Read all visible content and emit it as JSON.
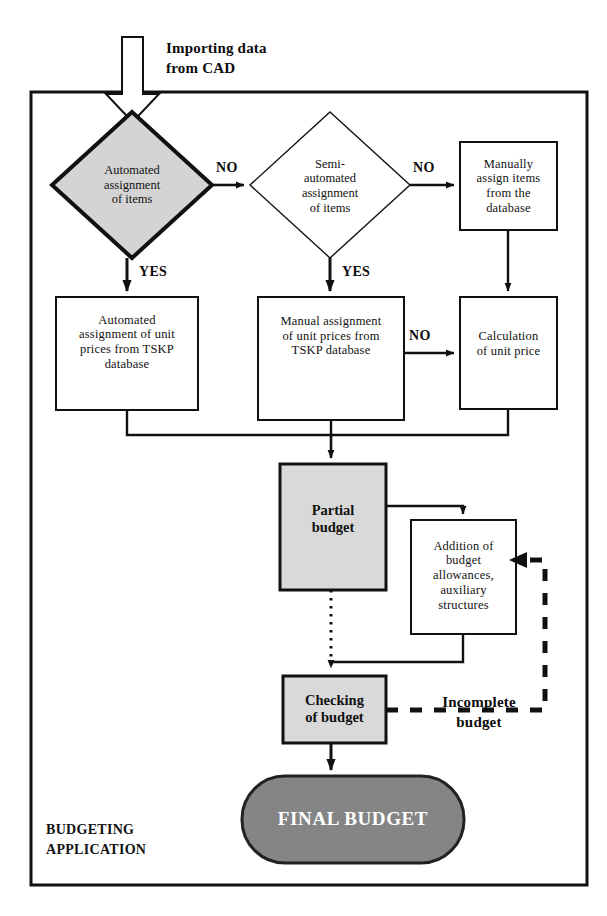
{
  "diagram": {
    "container_label_line1": "BUDGETING",
    "container_label_line2": "APPLICATION",
    "entry_label_line1": "Importing data",
    "entry_label_line2": "from CAD"
  },
  "nodes": {
    "automated_assignment": {
      "type": "decision",
      "line1": "Automated",
      "line2": "assignment",
      "line3": "of items",
      "fill": "#d4d4d4"
    },
    "semi_automated_assignment": {
      "type": "decision",
      "line1": "Semi-",
      "line2": "automated",
      "line3": "assignment",
      "line4": "of items",
      "fill": "#ffffff"
    },
    "manually_assign_items": {
      "type": "process",
      "line1": "Manually",
      "line2": "assign items",
      "line3": "from the",
      "line4": "database",
      "fill": "#ffffff"
    },
    "automated_unit_prices": {
      "type": "process",
      "line1": "Automated",
      "line2": "assignment of unit",
      "line3": "prices from TSKP",
      "line4": "database",
      "fill": "#ffffff"
    },
    "manual_unit_prices": {
      "type": "process",
      "line1": "Manual assignment",
      "line2": "of unit prices from",
      "line3": "TSKP database",
      "fill": "#ffffff"
    },
    "calculation_unit_price": {
      "type": "process",
      "line1": "Calculation",
      "line2": "of unit price",
      "fill": "#ffffff"
    },
    "partial_budget": {
      "type": "process",
      "line1": "Partial",
      "line2": "budget",
      "fill": "#d9d9d9"
    },
    "addition_allowances": {
      "type": "process",
      "line1": "Addition of",
      "line2": "budget",
      "line3": "allowances,",
      "line4": "auxiliary",
      "line5": "structures",
      "fill": "#ffffff"
    },
    "checking_budget": {
      "type": "process",
      "line1": "Checking",
      "line2": "of budget",
      "fill": "#d9d9d9"
    },
    "final_budget": {
      "type": "terminator",
      "label": "FINAL BUDGET",
      "fill": "#858585"
    }
  },
  "edges": {
    "automated_no": "NO",
    "automated_yes": "YES",
    "semi_no": "NO",
    "semi_yes": "YES",
    "manual_prices_no": "NO",
    "incomplete_line1": "Incomplete",
    "incomplete_line2": "budget"
  },
  "colors": {
    "stroke": "#111111",
    "decision_gray": "#d4d4d4",
    "box_gray": "#d9d9d9",
    "final_gray": "#858585",
    "background": "#ffffff"
  }
}
